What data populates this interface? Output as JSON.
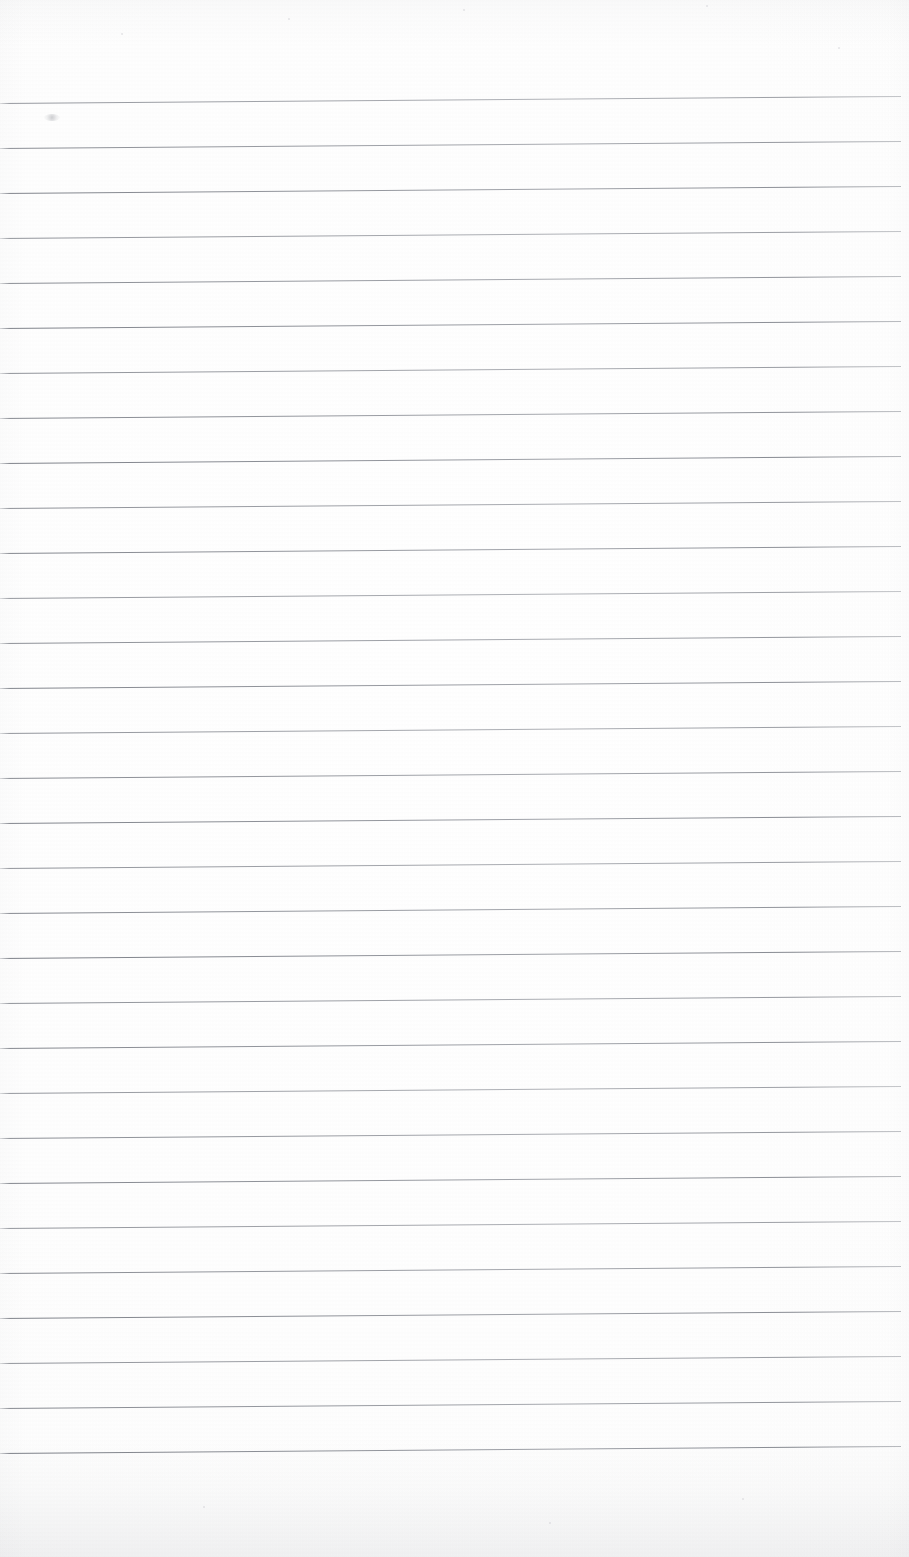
{
  "document": {
    "kind": "scanned-lined-paper",
    "title": "Blank ruled notebook page (scan)",
    "page_width": 909,
    "page_height": 1557,
    "orientation": "portrait",
    "visible_text": "",
    "handwriting_present": "no",
    "printed_text_present": "no"
  },
  "paper": {
    "background_color": "#ffffff",
    "tone_color": "#fdfdfd",
    "bottom_edge_shadow_color": "#8c8f96",
    "top_edge_shadow_color": "#a5a7ae",
    "texture": "faint scanner grain"
  },
  "ruling": {
    "line_color": "#6c7079",
    "line_thickness_px": 1,
    "line_count": 31,
    "spacing_px": 45,
    "first_line_y_left_px": 103,
    "last_line_y_left_px": 1457,
    "tilt_description": "lines rise slightly toward the right",
    "tilt_rise_px": 7,
    "line_start_x_px": 0,
    "line_end_x_px": 901,
    "margin_rule_present": "no",
    "header_area_height_px": 103
  },
  "marks": {
    "smudges": [
      {
        "name": "pencil-smudge",
        "x": 44,
        "y": 114,
        "width": 16,
        "height": 7
      }
    ],
    "specks": [
      {
        "x": 121,
        "y": 33,
        "size": 2
      },
      {
        "x": 288,
        "y": 18,
        "size": 2
      },
      {
        "x": 463,
        "y": 9,
        "size": 2
      },
      {
        "x": 706,
        "y": 5,
        "size": 2
      },
      {
        "x": 838,
        "y": 47,
        "size": 2
      },
      {
        "x": 203,
        "y": 1506,
        "size": 2
      },
      {
        "x": 549,
        "y": 1522,
        "size": 2
      },
      {
        "x": 742,
        "y": 1498,
        "size": 2
      }
    ]
  },
  "regions": {
    "header_label": "unruled top margin",
    "body_label": "ruled writing area",
    "footer_label": "unruled bottom margin"
  }
}
